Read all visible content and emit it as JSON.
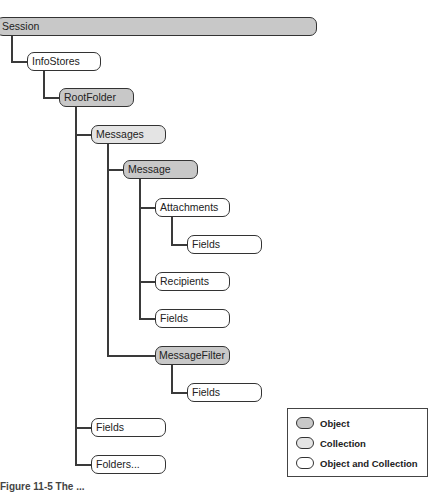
{
  "diagram": {
    "nodes": [
      {
        "id": "session",
        "label": "Session",
        "type": "object"
      },
      {
        "id": "infostores",
        "label": "InfoStores",
        "type": "object-and-collection"
      },
      {
        "id": "rootfolder",
        "label": "RootFolder",
        "type": "object"
      },
      {
        "id": "messages",
        "label": "Messages",
        "type": "collection"
      },
      {
        "id": "message",
        "label": "Message",
        "type": "object"
      },
      {
        "id": "attachments",
        "label": "Attachments",
        "type": "object-and-collection"
      },
      {
        "id": "attachments-fields",
        "label": "Fields",
        "type": "object-and-collection"
      },
      {
        "id": "recipients",
        "label": "Recipients",
        "type": "object-and-collection"
      },
      {
        "id": "message-fields",
        "label": "Fields",
        "type": "object-and-collection"
      },
      {
        "id": "messagefilter",
        "label": "MessageFilter",
        "type": "object"
      },
      {
        "id": "messagefilter-fields",
        "label": "Fields",
        "type": "object-and-collection"
      },
      {
        "id": "rootfolder-fields",
        "label": "Fields",
        "type": "object-and-collection"
      },
      {
        "id": "folders",
        "label": "Folders...",
        "type": "object-and-collection"
      }
    ],
    "edges": [
      [
        "session",
        "infostores"
      ],
      [
        "infostores",
        "rootfolder"
      ],
      [
        "rootfolder",
        "messages"
      ],
      [
        "rootfolder",
        "rootfolder-fields"
      ],
      [
        "rootfolder",
        "folders"
      ],
      [
        "messages",
        "message"
      ],
      [
        "messages",
        "messagefilter"
      ],
      [
        "message",
        "attachments"
      ],
      [
        "message",
        "recipients"
      ],
      [
        "message",
        "message-fields"
      ],
      [
        "attachments",
        "attachments-fields"
      ],
      [
        "messagefilter",
        "messagefilter-fields"
      ]
    ]
  },
  "legend": {
    "items": [
      {
        "label": "Object",
        "color": "#c8c8c8"
      },
      {
        "label": "Collection",
        "color": "#e4e4e4"
      },
      {
        "label": "Object and Collection",
        "color": "#ffffff"
      }
    ]
  },
  "caption": "Figure 11-5   The ..."
}
